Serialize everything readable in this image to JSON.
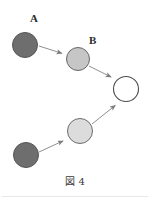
{
  "figure": {
    "caption": "図 4",
    "width": 150,
    "height": 199,
    "background": "#ffffff"
  },
  "labels": {
    "a": "A",
    "b": "B"
  },
  "colors": {
    "node_dark": "#6e6e6e",
    "node_mid": "#c6c6c6",
    "node_light": "#dcdcdc",
    "node_empty": "#ffffff",
    "node_stroke": "#555555",
    "arrow": "#8a8a8a",
    "text": "#2b2b2b",
    "rule": "#e8e8e8"
  },
  "chart_data": {
    "type": "diagram",
    "title": "図 4",
    "nodes": [
      {
        "id": "n1",
        "label": "A",
        "cx": 25,
        "cy": 45,
        "r": 12.5,
        "fill": "#6e6e6e",
        "stroke": "#555555",
        "shade": "dark"
      },
      {
        "id": "n2",
        "label": "B",
        "cx": 78,
        "cy": 59,
        "r": 11.5,
        "fill": "#c6c6c6",
        "stroke": "#666666",
        "shade": "medium"
      },
      {
        "id": "n3",
        "label": "",
        "cx": 126,
        "cy": 89,
        "r": 12.5,
        "fill": "#ffffff",
        "stroke": "#4d4d4d",
        "shade": "empty"
      },
      {
        "id": "n4",
        "label": "",
        "cx": 80,
        "cy": 131,
        "r": 12.5,
        "fill": "#dcdcdc",
        "stroke": "#6b6b6b",
        "shade": "light"
      },
      {
        "id": "n5",
        "label": "",
        "cx": 26,
        "cy": 155,
        "r": 12.5,
        "fill": "#6e6e6e",
        "stroke": "#555555",
        "shade": "dark"
      }
    ],
    "edges": [
      {
        "id": "e1",
        "from": "n1",
        "to": "n2",
        "x1": 39,
        "y1": 46,
        "x2": 64,
        "y2": 54
      },
      {
        "id": "e2",
        "from": "n2",
        "to": "n3",
        "x1": 89,
        "y1": 66,
        "x2": 113,
        "y2": 78
      },
      {
        "id": "e3",
        "from": "n4",
        "to": "n3",
        "x1": 92,
        "y1": 124,
        "x2": 117,
        "y2": 104
      },
      {
        "id": "e4",
        "from": "n5",
        "to": "n4",
        "x1": 39,
        "y1": 152,
        "x2": 65,
        "y2": 140
      }
    ]
  }
}
